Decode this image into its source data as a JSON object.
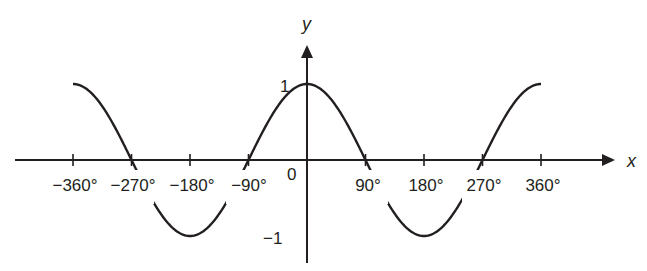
{
  "chart_data": {
    "type": "line",
    "title": "",
    "function": "y = cos x",
    "xlabel": "x",
    "ylabel": "y",
    "xlim": [
      -360,
      360
    ],
    "ylim": [
      -1,
      1
    ],
    "grid": false,
    "legend": null,
    "x_ticks": [
      -360,
      -270,
      -180,
      -90,
      90,
      180,
      270,
      360
    ],
    "x_tick_labels": [
      "−360°",
      "−270°",
      "−180°",
      "−90°",
      "90°",
      "180°",
      "270°",
      "360°"
    ],
    "y_tick_labels": [
      "1",
      "−1"
    ],
    "origin_label": "0",
    "series": [
      {
        "name": "cos x",
        "x": [
          -360,
          -270,
          -180,
          -90,
          0,
          90,
          180,
          270,
          360
        ],
        "values": [
          1,
          0,
          -1,
          0,
          1,
          0,
          -1,
          0,
          1
        ]
      }
    ],
    "colors": {
      "curve": "#231f20",
      "axes": "#231f20"
    }
  },
  "labels": {
    "x_axis": "x",
    "y_axis": "y",
    "origin": "0",
    "y_one": "1",
    "y_minus_one": "−1",
    "x_ticks": [
      "−360°",
      "−270°",
      "−180°",
      "−90°",
      "90°",
      "180°",
      "270°",
      "360°"
    ]
  }
}
